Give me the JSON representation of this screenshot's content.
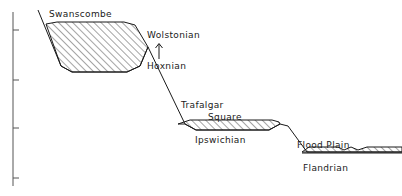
{
  "figure": {
    "type": "cross-section-diagram",
    "background_color": "#ffffff",
    "line_color": "#1a1a1a"
  },
  "axis": {
    "name": "vertical-scale-axis",
    "orientation": "vertical",
    "x": 13,
    "y_top": 12,
    "y_bottom": 186,
    "ticks": [
      {
        "y": 30
      },
      {
        "y": 80
      },
      {
        "y": 128
      },
      {
        "y": 178
      }
    ]
  },
  "labels": {
    "swanscombe": "Swanscombe",
    "wolstonian": "Wolstonian",
    "hoxnian": "Hoxnian",
    "trafalgar": "Trafalgar",
    "square": "Square",
    "ipswichian": "Ipswichian",
    "flood_plain": "Flood  Plain",
    "flandrian": "Flandrian"
  },
  "arrow": {
    "name": "wolstonian-hoxnian-arrow",
    "direction": "up",
    "x": 159,
    "y_tail": 59,
    "y_head": 44
  },
  "profile": {
    "comment": "Main ground-surface profile polyline, left to right",
    "points": [
      [
        38,
        10
      ],
      [
        61,
        66
      ],
      [
        72,
        72
      ],
      [
        127,
        72
      ],
      [
        140,
        66
      ],
      [
        148,
        47
      ],
      [
        185,
        124
      ],
      [
        196,
        130
      ],
      [
        269,
        130
      ],
      [
        280,
        124
      ],
      [
        288,
        126
      ],
      [
        307,
        152
      ],
      [
        402,
        152
      ]
    ]
  },
  "terraces": [
    {
      "name": "swanscombe-terrace",
      "label": "Swanscombe",
      "hatched": true,
      "outline": [
        [
          46,
          24
        ],
        [
          61,
          66
        ],
        [
          72,
          72
        ],
        [
          127,
          72
        ],
        [
          140,
          66
        ],
        [
          148,
          47
        ],
        [
          135,
          25
        ],
        [
          124,
          22
        ],
        [
          57,
          22
        ]
      ]
    },
    {
      "name": "trafalgar-square-terrace",
      "label": "Trafalgar Square",
      "hatched": true,
      "outline": [
        [
          178,
          124
        ],
        [
          185,
          124
        ],
        [
          196,
          130
        ],
        [
          269,
          130
        ],
        [
          280,
          124
        ],
        [
          279,
          122
        ],
        [
          272,
          120
        ],
        [
          190,
          120
        ]
      ]
    },
    {
      "name": "flood-plain-terrace",
      "label": "Flood Plain",
      "hatched": true,
      "outline": [
        [
          302,
          152
        ],
        [
          402,
          152
        ],
        [
          402,
          147
        ],
        [
          367,
          147
        ],
        [
          358,
          150
        ],
        [
          351,
          147
        ],
        [
          344,
          150
        ],
        [
          338,
          147
        ],
        [
          309,
          147
        ]
      ],
      "has_channel_notch": true
    }
  ],
  "hatching": {
    "angle_degrees": 45,
    "spacing_px": 5,
    "stroke_width": 0.8
  }
}
